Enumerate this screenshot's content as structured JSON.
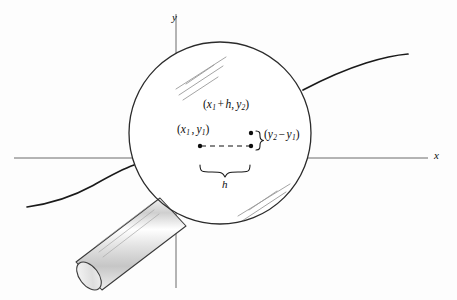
{
  "figure": {
    "axes": {
      "x_label": "x",
      "y_label": "y"
    },
    "labels": {
      "point1_open": "(",
      "point1": "(x1 , y1)",
      "point2": "(x1 + h, y2)",
      "rise": "(y2 - y1)",
      "run": "h"
    },
    "point1_parts": {
      "open": "(",
      "x_var": "x",
      "x_sub": "1",
      "comma": ",",
      "y_var": "y",
      "y_sub": "1",
      "close": ")"
    },
    "point2_parts": {
      "open": "(",
      "x_var": "x",
      "x_sub": "1",
      "plus": "+",
      "h_var": "h",
      "comma": ",",
      "y_var": "y",
      "y_sub": "2",
      "close": ")"
    },
    "rise_parts": {
      "brace": "}",
      "open": "(",
      "y_var": "y",
      "y_sub2": "2",
      "minus": "−",
      "y_var2": "y",
      "y_sub1": "1",
      "close": ")"
    },
    "run_parts": {
      "h_var": "h"
    },
    "colors": {
      "ink": "#0d0d0d",
      "axis": "#6b6b6b",
      "lens_outline": "#2b2b2b",
      "curve": "#1a1a1a",
      "handle_outline": "#3a3a3a",
      "highlight": "#8c8c8c",
      "background": "#fdfdfd"
    },
    "geometry": {
      "lens_center_x": 220,
      "lens_center_y": 133,
      "lens_radius": 91,
      "x_axis_y": 158,
      "y_axis_x": 176,
      "point1_x": 200,
      "point1_y": 146,
      "point2_x": 251,
      "point2_y": 133
    }
  }
}
